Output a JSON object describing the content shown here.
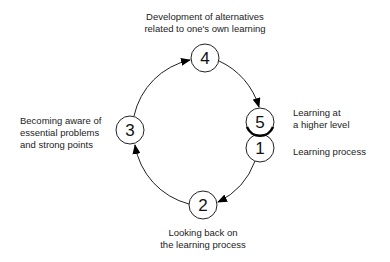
{
  "diagram": {
    "type": "cycle",
    "nodes": [
      {
        "id": "1",
        "number": "1",
        "label": "Learning process"
      },
      {
        "id": "2",
        "number": "2",
        "label_line1": "Looking back on",
        "label_line2": "the learning process"
      },
      {
        "id": "3",
        "number": "3",
        "label_line1": "Becoming aware of",
        "label_line2": "essential problems",
        "label_line3": "and strong points"
      },
      {
        "id": "4",
        "number": "4",
        "label_line1": "Development of alternatives",
        "label_line2": "related to one's own learning"
      },
      {
        "id": "5",
        "number": "5",
        "label_line1": "Learning at",
        "label_line2": "a higher level"
      }
    ],
    "edges": [
      {
        "from": "1",
        "to": "2"
      },
      {
        "from": "2",
        "to": "3"
      },
      {
        "from": "3",
        "to": "4"
      },
      {
        "from": "4",
        "to": "5"
      }
    ]
  }
}
